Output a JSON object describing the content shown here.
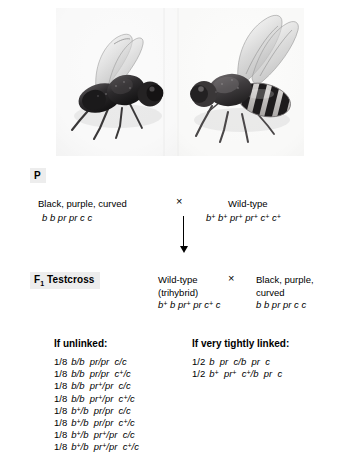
{
  "figure": {
    "organism": "Drosophila",
    "photos": [
      {
        "name": "fly-photo-mutant",
        "caption": "Black, purple, curved"
      },
      {
        "name": "fly-photo-wildtype",
        "caption": "Wild-type"
      }
    ]
  },
  "p_generation": {
    "label": "P",
    "cross_symbol": "×",
    "left": {
      "phenotype": "Black, purple, curved",
      "genotype": "b b pr pr c c"
    },
    "right": {
      "phenotype": "Wild-type",
      "genotype": "b+ b+ pr+ pr+ c+ c+"
    }
  },
  "f1_testcross": {
    "label": "F1 Testcross",
    "label_main": "F",
    "label_sub": "1",
    "label_rest": " Testcross",
    "cross_symbol": "×",
    "left": {
      "phenotype_line1": "Wild-type",
      "phenotype_line2": "(trihybrid)",
      "genotype": "b+ b pr+ pr c+ c"
    },
    "right": {
      "phenotype_line1": "Black, purple,",
      "phenotype_line2": "curved",
      "genotype": "b b pr pr c c"
    }
  },
  "progeny": {
    "unlinked": {
      "heading": "If unlinked:",
      "rows": [
        {
          "fraction": "1/8",
          "genotype": "b/b pr/pr c/c"
        },
        {
          "fraction": "1/8",
          "genotype": "b/b pr/pr c+/c"
        },
        {
          "fraction": "1/8",
          "genotype": "b/b pr+/pr c/c"
        },
        {
          "fraction": "1/8",
          "genotype": "b/b pr+/pr c+/c"
        },
        {
          "fraction": "1/8",
          "genotype": "b+/b pr/pr c/c"
        },
        {
          "fraction": "1/8",
          "genotype": "b+/b pr/pr c+/c"
        },
        {
          "fraction": "1/8",
          "genotype": "b+/b pr+/pr c/c"
        },
        {
          "fraction": "1/8",
          "genotype": "b+/b pr+/pr c+/c"
        }
      ]
    },
    "linked": {
      "heading": "If very tightly linked:",
      "rows": [
        {
          "fraction": "1/2",
          "genotype": "b pr c/b pr c"
        },
        {
          "fraction": "1/2",
          "genotype": "b+ pr+ c+/b pr c"
        }
      ]
    }
  },
  "colors": {
    "background": "#ffffff",
    "text": "#000000",
    "label_chip": "#ededed"
  }
}
